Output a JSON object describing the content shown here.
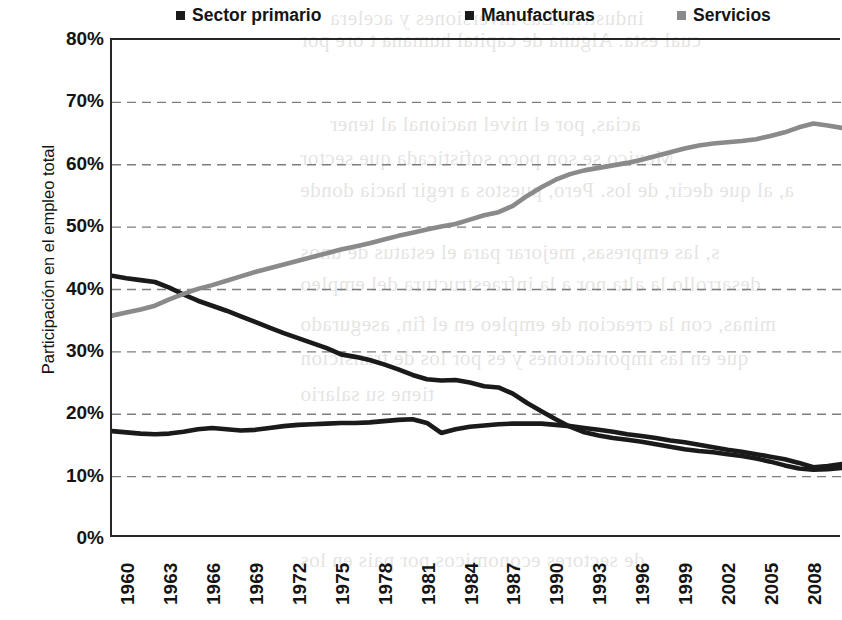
{
  "legend": {
    "items": [
      {
        "label": "Sector primario",
        "color": "#1a1a1a"
      },
      {
        "label": "Manufacturas",
        "color": "#1a1a1a"
      },
      {
        "label": "Servicios",
        "color": "#8a8a8a"
      }
    ]
  },
  "axes": {
    "ylabel": "Participación en el empleo total",
    "yticks": [
      "80%",
      "70%",
      "60%",
      "50%",
      "40%",
      "30%",
      "20%",
      "10%",
      "0%"
    ],
    "xticks": [
      "1960",
      "1963",
      "1966",
      "1969",
      "1972",
      "1975",
      "1978",
      "1981",
      "1984",
      "1987",
      "1990",
      "1993",
      "1996",
      "1999",
      "2002",
      "2005",
      "2008"
    ]
  },
  "chart_data": {
    "type": "line",
    "title": "",
    "xlabel": "",
    "ylabel": "Participación en el empleo total",
    "ylim": [
      0,
      80
    ],
    "xlim": [
      1960,
      2011
    ],
    "grid": "horizontal-dashed",
    "legend_position": "top",
    "x": [
      1960,
      1961,
      1962,
      1963,
      1964,
      1965,
      1966,
      1967,
      1968,
      1969,
      1970,
      1971,
      1972,
      1973,
      1974,
      1975,
      1976,
      1977,
      1978,
      1979,
      1980,
      1981,
      1982,
      1983,
      1984,
      1985,
      1986,
      1987,
      1988,
      1989,
      1990,
      1991,
      1992,
      1993,
      1994,
      1995,
      1996,
      1997,
      1998,
      1999,
      2000,
      2001,
      2002,
      2003,
      2004,
      2005,
      2006,
      2007,
      2008,
      2009,
      2010,
      2011
    ],
    "series": [
      {
        "name": "Sector primario",
        "color": "#1a1a1a",
        "values": [
          42.2,
          41.8,
          41.5,
          41.2,
          40.3,
          39.2,
          38.2,
          37.4,
          36.6,
          35.7,
          34.8,
          33.9,
          33.0,
          32.2,
          31.4,
          30.6,
          29.6,
          29.2,
          28.7,
          28.0,
          27.2,
          26.3,
          25.6,
          25.4,
          25.5,
          25.1,
          24.5,
          24.3,
          23.3,
          21.8,
          20.5,
          19.2,
          18.0,
          17.1,
          16.6,
          16.2,
          15.9,
          15.6,
          15.2,
          14.8,
          14.4,
          14.1,
          13.9,
          13.6,
          13.3,
          12.9,
          12.4,
          11.8,
          11.3,
          11.1,
          11.2,
          11.4
        ]
      },
      {
        "name": "Manufacturas",
        "color": "#1a1a1a",
        "values": [
          17.3,
          17.1,
          16.9,
          16.8,
          16.9,
          17.2,
          17.6,
          17.8,
          17.6,
          17.4,
          17.5,
          17.8,
          18.1,
          18.3,
          18.4,
          18.5,
          18.6,
          18.6,
          18.7,
          18.9,
          19.1,
          19.2,
          18.6,
          17.0,
          17.6,
          18.0,
          18.2,
          18.4,
          18.5,
          18.5,
          18.5,
          18.3,
          18.1,
          17.8,
          17.5,
          17.2,
          16.8,
          16.5,
          16.2,
          15.8,
          15.5,
          15.1,
          14.7,
          14.3,
          14.0,
          13.6,
          13.2,
          12.8,
          12.2,
          11.5,
          11.7,
          12.0
        ]
      },
      {
        "name": "Servicios",
        "color": "#8a8a8a",
        "values": [
          35.8,
          36.3,
          36.8,
          37.4,
          38.4,
          39.3,
          40.1,
          40.7,
          41.4,
          42.1,
          42.8,
          43.4,
          44.0,
          44.6,
          45.2,
          45.8,
          46.4,
          46.9,
          47.4,
          48.0,
          48.6,
          49.1,
          49.6,
          50.1,
          50.5,
          51.2,
          51.9,
          52.4,
          53.4,
          55.0,
          56.4,
          57.6,
          58.5,
          59.1,
          59.5,
          59.9,
          60.3,
          60.8,
          61.4,
          62.0,
          62.6,
          63.1,
          63.4,
          63.6,
          63.8,
          64.1,
          64.6,
          65.2,
          66.0,
          66.6,
          66.3,
          65.9
        ]
      }
    ]
  },
  "bleed_text": [
    {
      "text": "industria. Las inversiones y acelera",
      "x": 330,
      "y": 6
    },
    {
      "text": "cual esta. Alguna de capital humana t ore por",
      "x": 300,
      "y": 28
    },
    {
      "text": "acias, por el nivel nacional al tener",
      "x": 330,
      "y": 112
    },
    {
      "text": "Mexico se son poco sofisticada que sector",
      "x": 300,
      "y": 146
    },
    {
      "text": "a, al que decir, de los. Pero, puestos a regir hacia donde",
      "x": 300,
      "y": 178
    },
    {
      "text": "s, las empresas, mejorar para el estatus de unos",
      "x": 300,
      "y": 240
    },
    {
      "text": "desarrollo la alta nor a la infraestructura del empleo",
      "x": 300,
      "y": 272
    },
    {
      "text": "minas, con la creacion de empleo en el fin, asegurado",
      "x": 300,
      "y": 312
    },
    {
      "text": "que en las importaciones y es por los de transicion",
      "x": 300,
      "y": 346
    },
    {
      "text": "tiene su salario",
      "x": 300,
      "y": 382
    },
    {
      "text": "de sectores economicos por pais en los",
      "x": 300,
      "y": 548
    }
  ]
}
